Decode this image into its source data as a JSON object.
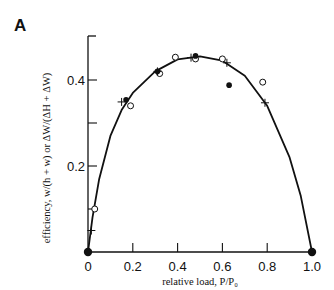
{
  "panel": {
    "label": "A"
  },
  "chart_data": {
    "type": "scatter",
    "title": "",
    "xlabel": "relative load, P/P₀",
    "ylabel": "efficiency, w/(h + w) or ΔW/(ΔH + ΔW)",
    "xlim": [
      0,
      1.0
    ],
    "ylim": [
      0,
      0.5
    ],
    "x_ticks": [
      "0",
      "0.2",
      "0.4",
      "0.6",
      "0.8",
      "1.0"
    ],
    "y_ticks": [
      "0.2",
      "0.4"
    ],
    "grid": false,
    "legend": null,
    "series": [
      {
        "name": "open circles",
        "marker": "open-circle",
        "points": [
          [
            0.03,
            0.1
          ],
          [
            0.19,
            0.34
          ],
          [
            0.32,
            0.415
          ],
          [
            0.39,
            0.453
          ],
          [
            0.48,
            0.449
          ],
          [
            0.6,
            0.449
          ],
          [
            0.78,
            0.395
          ]
        ]
      },
      {
        "name": "filled circles",
        "marker": "filled-circle",
        "points": [
          [
            0.0,
            0.0
          ],
          [
            0.17,
            0.354
          ],
          [
            0.31,
            0.42
          ],
          [
            0.48,
            0.456
          ],
          [
            0.63,
            0.388
          ],
          [
            1.0,
            0.0
          ]
        ]
      },
      {
        "name": "crosses",
        "marker": "plus",
        "points": [
          [
            0.015,
            0.05
          ],
          [
            0.15,
            0.349
          ],
          [
            0.31,
            0.42
          ],
          [
            0.46,
            0.452
          ],
          [
            0.62,
            0.44
          ],
          [
            0.79,
            0.347
          ]
        ]
      },
      {
        "name": "fitted curve",
        "marker": "line",
        "points": [
          [
            0.0,
            0.0
          ],
          [
            0.02,
            0.08
          ],
          [
            0.05,
            0.17
          ],
          [
            0.1,
            0.27
          ],
          [
            0.15,
            0.33
          ],
          [
            0.2,
            0.37
          ],
          [
            0.3,
            0.42
          ],
          [
            0.4,
            0.448
          ],
          [
            0.5,
            0.455
          ],
          [
            0.6,
            0.445
          ],
          [
            0.7,
            0.41
          ],
          [
            0.8,
            0.34
          ],
          [
            0.9,
            0.22
          ],
          [
            0.95,
            0.13
          ],
          [
            1.0,
            0.0
          ]
        ]
      }
    ]
  }
}
